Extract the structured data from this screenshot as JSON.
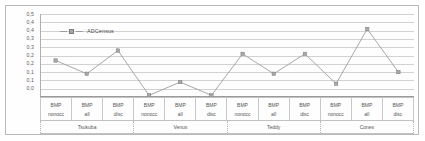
{
  "chart_data": {
    "type": "line",
    "title": "",
    "xlabel": "",
    "ylabel": "",
    "ylim": [
      0.0,
      0.5
    ],
    "grid": true,
    "legend_position": "top-left",
    "ytick_labels": [
      "0,5",
      "0,4",
      "0,4",
      "0,3",
      "0,3",
      "0,2",
      "0,2",
      "0,1",
      "0,1",
      "0,0"
    ],
    "ytick_values": [
      0.5,
      0.45,
      0.4,
      0.35,
      0.3,
      0.25,
      0.2,
      0.15,
      0.1,
      0.05,
      0.0
    ],
    "categories": [
      "BMP nonocc",
      "BMP all",
      "BMP disc",
      "BMP nonocc",
      "BMP all",
      "BMP disc",
      "BMP nonocc",
      "BMP all",
      "BMP disc",
      "BMP nonocc",
      "BMP all",
      "BMP disc"
    ],
    "metric_top": [
      "BMP",
      "BMP",
      "BMP",
      "BMP",
      "BMP",
      "BMP",
      "BMP",
      "BMP",
      "BMP",
      "BMP",
      "BMP",
      "BMP"
    ],
    "metric_bottom": [
      "nonocc",
      "all",
      "disc",
      "nonocc",
      "all",
      "disc",
      "nonocc",
      "all",
      "disc",
      "nonocc",
      "all",
      "disc"
    ],
    "groups": [
      {
        "label": "Tsukuba",
        "span": 3
      },
      {
        "label": "Venus",
        "span": 3
      },
      {
        "label": "Teddy",
        "span": 3
      },
      {
        "label": "Cones",
        "span": 3
      }
    ],
    "series": [
      {
        "name": "ADCensus",
        "color": "#9d9d9d",
        "marker_color": "#a8a8a8",
        "values": [
          0.22,
          0.14,
          0.28,
          0.01,
          0.09,
          0.01,
          0.26,
          0.14,
          0.26,
          0.08,
          0.41,
          0.15
        ]
      }
    ]
  },
  "legend": {
    "entries": [
      {
        "label": "ADCensus"
      }
    ]
  },
  "colors": {
    "frame": "#b9b9b9",
    "grid": "#d2d2d2",
    "series": "#9d9d9d",
    "text": "#555555"
  }
}
